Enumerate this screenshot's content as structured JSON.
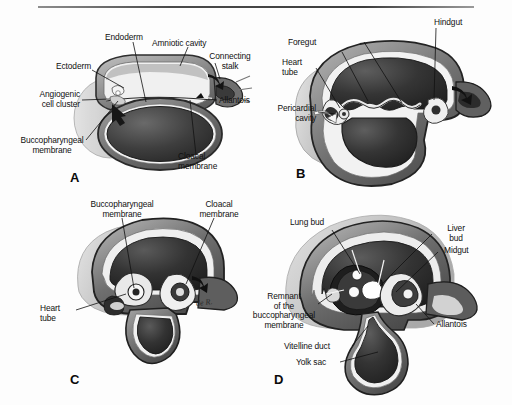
{
  "figure": {
    "rule_present": true,
    "background_color": "#fdfdfd",
    "ink_color": "#101010"
  },
  "panels": [
    {
      "id": "A",
      "letter": "A",
      "labels": [
        {
          "name": "endoderm",
          "text": "Endoderm"
        },
        {
          "name": "amniotic-cavity",
          "text": "Amniotic cavity"
        },
        {
          "name": "ectoderm",
          "text": "Ectoderm"
        },
        {
          "name": "connecting-stalk",
          "text": "Connecting\nstalk"
        },
        {
          "name": "angiogenic-cell-cluster",
          "text": "Angiogenic\ncell cluster"
        },
        {
          "name": "allantois",
          "text": "Allantois"
        },
        {
          "name": "buccopharyngeal-membrane",
          "text": "Buccopharyngeal\nmembrane"
        },
        {
          "name": "cloacal-membrane",
          "text": "Cloacal\nmembrane"
        }
      ]
    },
    {
      "id": "B",
      "letter": "B",
      "labels": [
        {
          "name": "hindgut",
          "text": "Hindgut"
        },
        {
          "name": "foregut",
          "text": "Foregut"
        },
        {
          "name": "heart-tube",
          "text": "Heart\ntube"
        },
        {
          "name": "pericardial-cavity",
          "text": "Pericardial\ncavity"
        }
      ]
    },
    {
      "id": "C",
      "letter": "C",
      "signature": "de R.",
      "labels": [
        {
          "name": "buccopharyngeal-membrane",
          "text": "Buccopharyngeal\nmembrane"
        },
        {
          "name": "cloacal-membrane",
          "text": "Cloacal\nmembrane"
        },
        {
          "name": "heart-tube",
          "text": "Heart\ntube"
        }
      ]
    },
    {
      "id": "D",
      "letter": "D",
      "labels": [
        {
          "name": "lung-bud",
          "text": "Lung bud"
        },
        {
          "name": "liver-bud",
          "text": "Liver\nbud"
        },
        {
          "name": "midgut",
          "text": "Midgut"
        },
        {
          "name": "remnant-of-buccopharyngeal-membrane",
          "text": "Remnant\nof the\nbuccopharyngeal\nmembrane"
        },
        {
          "name": "allantois",
          "text": "Allantois"
        },
        {
          "name": "vitelline-duct",
          "text": "Vitelline duct"
        },
        {
          "name": "yolk-sac",
          "text": "Yolk sac"
        }
      ]
    }
  ]
}
